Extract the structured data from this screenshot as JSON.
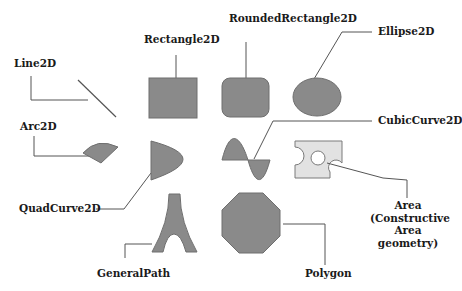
{
  "diagram": {
    "colors": {
      "shape_fill": "#8a8a8a",
      "shape_stroke": "#6e6e6e",
      "area_fill": "#e2e2e2",
      "area_stroke": "#7a7a7a",
      "line": "#555555",
      "text": "#1a1a1a"
    },
    "labels": {
      "line2d": "Line2D",
      "rectangle2d": "Rectangle2D",
      "roundedrectangle2d": "RoundedRectangle2D",
      "ellipse2d": "Ellipse2D",
      "arc2d": "Arc2D",
      "cubiccurve2d": "CubicCurve2D",
      "quadcurve2d": "QuadCurve2D",
      "area_line1": "Area",
      "area_line2": "(Constructive",
      "area_line3": "Area",
      "area_line4": "geometry)",
      "generalpath": "GeneralPath",
      "polygon": "Polygon"
    },
    "shapes": [
      {
        "id": "line2d",
        "type": "line"
      },
      {
        "id": "rectangle2d",
        "type": "rectangle"
      },
      {
        "id": "roundedrectangle2d",
        "type": "rounded-rectangle"
      },
      {
        "id": "ellipse2d",
        "type": "ellipse"
      },
      {
        "id": "arc2d",
        "type": "arc-pie"
      },
      {
        "id": "quadcurve2d",
        "type": "quadratic-curve"
      },
      {
        "id": "cubiccurve2d",
        "type": "cubic-curve"
      },
      {
        "id": "area",
        "type": "constructive-area"
      },
      {
        "id": "generalpath",
        "type": "general-path"
      },
      {
        "id": "polygon",
        "type": "octagon"
      }
    ]
  }
}
